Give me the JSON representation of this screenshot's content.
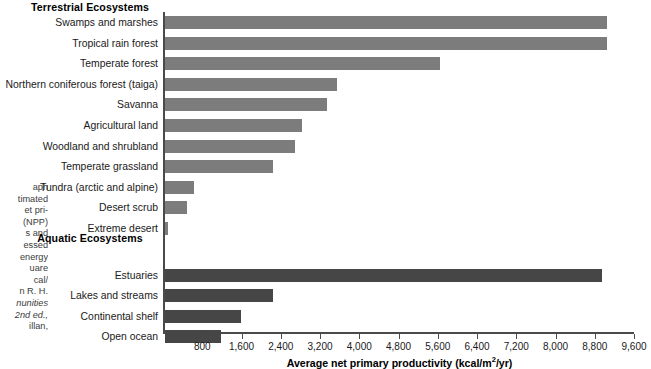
{
  "caption": {
    "lines": [
      "aph",
      "timated",
      "et pri-",
      "(NPP)",
      "s and",
      "essed",
      "energy",
      "uare",
      "cal/",
      "n R. H.",
      "nunities",
      "2nd ed.,",
      "illan,"
    ]
  },
  "headings": {
    "terrestrial": "Terrestrial Ecosystems",
    "aquatic": "Aquatic Ecosystems"
  },
  "colors": {
    "terrestrial_bar": "#7c7c7c",
    "aquatic_bar": "#464646",
    "axis": "#4a4a4a"
  },
  "chart_data": {
    "type": "bar",
    "orientation": "horizontal",
    "title": "",
    "xlabel": "Average net primary productivity (kcal/m2/yr)",
    "xlabel_display": "Average net primary productivity (kcal/m",
    "xlabel_sup": "2",
    "xlabel_tail": "/yr)",
    "ylabel": "",
    "xlim": [
      0,
      9600
    ],
    "grid": false,
    "legend": "none",
    "ticks": [
      800,
      1600,
      2400,
      3200,
      4000,
      4800,
      5600,
      6400,
      7200,
      8000,
      8800,
      9600
    ],
    "tick_labels": [
      "800",
      "1,600",
      "2,400",
      "3,200",
      "4,000",
      "4,800",
      "5,600",
      "6,400",
      "7,200",
      "8,000",
      "8,800",
      "9,600"
    ],
    "groups": [
      {
        "name": "Terrestrial Ecosystems",
        "categories": [
          "Swamps and marshes",
          "Tropical rain forest",
          "Temperate forest",
          "Northern coniferous forest (taiga)",
          "Savanna",
          "Agricultural land",
          "Woodland and shrubland",
          "Temperate grassland",
          "Tundra (arctic and alpine)",
          "Desert scrub",
          "Extreme desert"
        ],
        "values": [
          9000,
          9000,
          5600,
          3500,
          3300,
          2800,
          2650,
          2200,
          600,
          450,
          70
        ]
      },
      {
        "name": "Aquatic Ecosystems",
        "categories": [
          "Estuaries",
          "Lakes and streams",
          "Continental shelf",
          "Open ocean"
        ],
        "values": [
          8900,
          2200,
          1550,
          1150
        ]
      }
    ]
  }
}
